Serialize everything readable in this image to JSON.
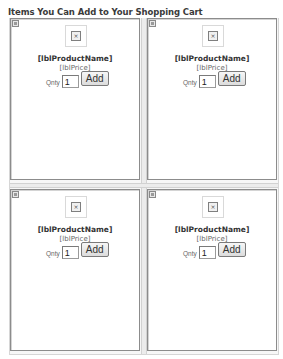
{
  "page": {
    "title": "Items You Can Add to Your Shopping Cart"
  },
  "products": [
    {
      "name": "[lblProductName]",
      "price": "[lblPrice]",
      "qty_label": "Qnty",
      "qty_value": "1",
      "add_label": "Add",
      "image_icon": "broken-image-icon"
    },
    {
      "name": "[lblProductName]",
      "price": "[lblPrice]",
      "qty_label": "Qnty",
      "qty_value": "1",
      "add_label": "Add",
      "image_icon": "broken-image-icon"
    },
    {
      "name": "[lblProductName]",
      "price": "[lblPrice]",
      "qty_label": "Qnty",
      "qty_value": "1",
      "add_label": "Add",
      "image_icon": "broken-image-icon"
    },
    {
      "name": "[lblProductName]",
      "price": "[lblPrice]",
      "qty_label": "Qnty",
      "qty_value": "1",
      "add_label": "Add",
      "image_icon": "broken-image-icon"
    }
  ],
  "icons": {
    "broken_image_glyph": "×"
  }
}
